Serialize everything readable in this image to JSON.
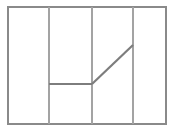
{
  "figure": {
    "title": "",
    "canvas": {
      "width": 174,
      "height": 131,
      "background": "#ffffff"
    },
    "colors": {
      "border": "#8a8a8a",
      "divider": "#a3a3a3",
      "path": "#7d7d7d"
    },
    "frame": {
      "name": "outer-rectangle",
      "x1": 8,
      "y1": 7,
      "x2": 166,
      "y2": 124,
      "stroke": "#8a8a8a",
      "stroke_width": 1.6
    },
    "dividers": [
      {
        "name": "vertical-divider-1",
        "x": 49,
        "y1": 7,
        "y2": 124,
        "stroke": "#a3a3a3",
        "stroke_width": 1.2
      },
      {
        "name": "vertical-divider-2",
        "x": 92,
        "y1": 7,
        "y2": 124,
        "stroke": "#a3a3a3",
        "stroke_width": 1.2
      },
      {
        "name": "vertical-divider-3",
        "x": 133,
        "y1": 7,
        "y2": 124,
        "stroke": "#a3a3a3",
        "stroke_width": 1.2
      }
    ],
    "path_segments": [
      {
        "name": "horizontal-segment",
        "x1": 49,
        "y1": 84,
        "x2": 92,
        "y2": 84,
        "stroke": "#7d7d7d",
        "stroke_width": 2.2
      },
      {
        "name": "diagonal-segment",
        "x1": 92,
        "y1": 84,
        "x2": 133,
        "y2": 45,
        "stroke": "#7d7d7d",
        "stroke_width": 2.2
      }
    ]
  },
  "chart_data": {
    "type": "line",
    "title": "",
    "xlabel": "",
    "ylabel": "",
    "grid": true,
    "legend": null,
    "xlim": [
      8,
      166
    ],
    "ylim": [
      7,
      124
    ],
    "gridlines_x": [
      49,
      92,
      133
    ],
    "series": [
      {
        "name": "step-ramp",
        "x": [
          49,
          92,
          133
        ],
        "y": [
          84,
          84,
          45
        ]
      }
    ]
  }
}
